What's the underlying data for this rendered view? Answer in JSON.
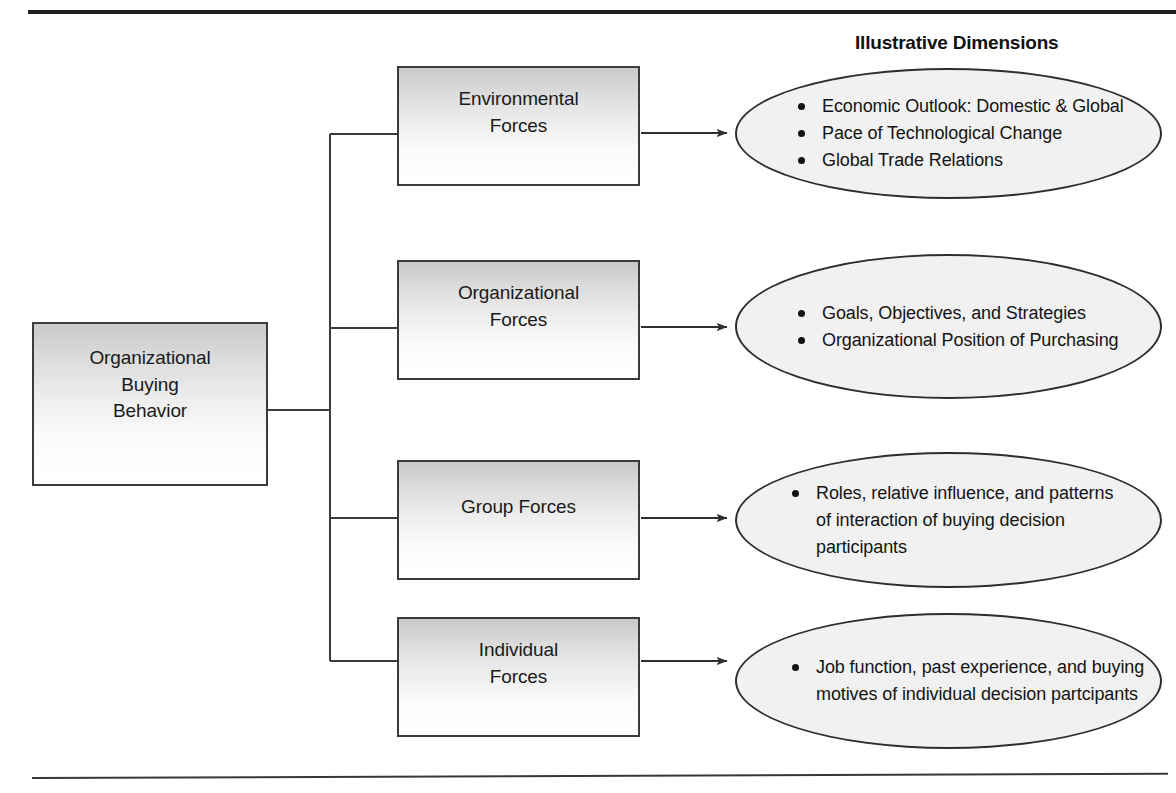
{
  "figure": {
    "heading": "Illustrative Dimensions",
    "root": {
      "label": "Organizational\nBuying\nBehavior"
    },
    "branches": [
      {
        "box_label": "Environmental\nForces",
        "dimensions": [
          "Economic Outlook: Domestic & Global",
          "Pace of Technological Change",
          "Global Trade Relations"
        ]
      },
      {
        "box_label": "Organizational\nForces",
        "dimensions": [
          "Goals, Objectives, and Strategies",
          "Organizational Position of Purchasing"
        ]
      },
      {
        "box_label": "Group Forces",
        "dimensions": [
          "Roles, relative influence, and patterns\nof interaction of buying decision participants"
        ]
      },
      {
        "box_label": "Individual\nForces",
        "dimensions": [
          "Job function, past experience, and buying\nmotives of individual decision partcipants"
        ]
      }
    ],
    "colors": {
      "line": "#3b3b3b",
      "box_fill_top": "#c9c9c9",
      "box_fill_bottom": "#ffffff",
      "ellipse_fill": "#f1f1f1",
      "rule": "#231f20",
      "text": "#111111"
    }
  }
}
